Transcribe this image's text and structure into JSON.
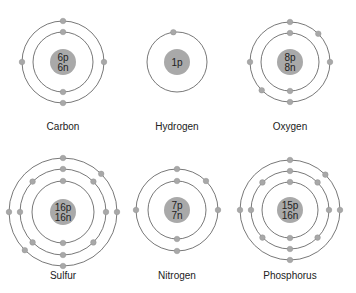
{
  "colors": {
    "orbit": "#555555",
    "electron": "#a8a8a8",
    "nucleus": "#a9a9a9",
    "nucleus_text": "#222222",
    "label": "#222222"
  },
  "atoms": [
    {
      "name": "Carbon",
      "protons": "6p",
      "neutrons": "6n",
      "cx": 63,
      "cy": 62,
      "label_y": 121,
      "shells": [
        {
          "r": 30,
          "electrons": [
            270,
            90
          ]
        },
        {
          "r": 41,
          "electrons": [
            270,
            0,
            90,
            180
          ]
        }
      ]
    },
    {
      "name": "Hydrogen",
      "protons": "1p",
      "neutrons": "",
      "cx": 177,
      "cy": 62,
      "label_y": 121,
      "shells": [
        {
          "r": 30,
          "electrons": [
            263
          ]
        }
      ]
    },
    {
      "name": "Oxygen",
      "protons": "8p",
      "neutrons": "8n",
      "cx": 290,
      "cy": 62,
      "label_y": 121,
      "shells": [
        {
          "r": 29,
          "electrons": [
            270,
            90
          ]
        },
        {
          "r": 40,
          "electrons": [
            270,
            315,
            0,
            90,
            135,
            180
          ]
        }
      ]
    },
    {
      "name": "Sulfur",
      "protons": "16p",
      "neutrons": "16n",
      "cx": 63,
      "cy": 212,
      "label_y": 270,
      "shells": [
        {
          "r": 31,
          "electrons": [
            270,
            90
          ]
        },
        {
          "r": 43,
          "electrons": [
            270,
            315,
            0,
            45,
            90,
            135,
            180,
            225
          ]
        },
        {
          "r": 54,
          "electrons": [
            270,
            315,
            0,
            90,
            135,
            180
          ]
        }
      ]
    },
    {
      "name": "Nitrogen",
      "protons": "7p",
      "neutrons": "7n",
      "cx": 177,
      "cy": 210,
      "label_y": 270,
      "shells": [
        {
          "r": 29,
          "electrons": [
            270,
            90
          ]
        },
        {
          "r": 41,
          "electrons": [
            270,
            315,
            0,
            90,
            180
          ]
        }
      ]
    },
    {
      "name": "Phosphorus",
      "protons": "15p",
      "neutrons": "16n",
      "cx": 290,
      "cy": 210,
      "label_y": 270,
      "shells": [
        {
          "r": 28,
          "electrons": [
            270,
            90
          ]
        },
        {
          "r": 39,
          "electrons": [
            270,
            315,
            0,
            45,
            90,
            135,
            180,
            225
          ]
        },
        {
          "r": 50,
          "electrons": [
            270,
            315,
            0,
            90,
            180
          ]
        }
      ]
    }
  ]
}
